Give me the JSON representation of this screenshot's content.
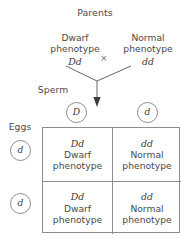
{
  "title": "Parents",
  "parents": [
    {
      "phenotype_line1": "Dwarf",
      "phenotype_line2": "phenotype",
      "genotype": "Dd"
    },
    {
      "phenotype_line1": "Normal",
      "phenotype_line2": "phenotype",
      "genotype": "dd"
    }
  ],
  "cross_symbol": "×",
  "gametes": {
    "sperm_label": "Sperm",
    "sperm": [
      "D",
      "d"
    ],
    "eggs_label": "Eggs",
    "eggs": [
      "d",
      "d"
    ]
  },
  "punnett": {
    "cells": [
      {
        "genotype": "Dd",
        "pheno_line1": "Dwarf",
        "pheno_line2": "phenotype"
      },
      {
        "genotype": "dd",
        "pheno_line1": "Normal",
        "pheno_line2": "phenotype"
      },
      {
        "genotype": "Dd",
        "pheno_line1": "Dwarf",
        "pheno_line2": "phenotype"
      },
      {
        "genotype": "dd",
        "pheno_line1": "Normal",
        "pheno_line2": "phenotype"
      }
    ]
  },
  "colors": {
    "text": "#4a4a4a",
    "genotype_text": "#3c3c3c",
    "line": "#8d8d8d",
    "arrow": "#4a4a4a",
    "background": "#ffffff"
  }
}
